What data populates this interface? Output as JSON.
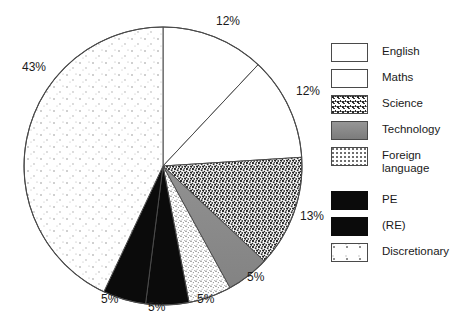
{
  "chart_data": {
    "type": "pie",
    "title": "",
    "subtitle": "",
    "xlabel": "",
    "ylabel": "",
    "units": "percent",
    "start_angle_deg": 0,
    "direction": "clockwise",
    "legend_position": "right",
    "grid": false,
    "categories": [
      "English",
      "Maths",
      "Science",
      "Technology",
      "Foreign language",
      "PE",
      "(RE)",
      "Discretionary"
    ],
    "values": [
      12,
      12,
      13,
      5,
      5,
      5,
      5,
      43
    ],
    "labels": [
      "12%",
      "12%",
      "13%",
      "5%",
      "5%",
      "5%",
      "5%",
      "43%"
    ],
    "slices": [
      {
        "name": "English",
        "value": 12,
        "label": "12%",
        "fill": "white",
        "color": "#ffffff",
        "start_deg": 0,
        "end_deg": 43.2
      },
      {
        "name": "Maths",
        "value": 12,
        "label": "12%",
        "fill": "white",
        "color": "#ffffff",
        "start_deg": 43.2,
        "end_deg": 86.4
      },
      {
        "name": "Science",
        "value": 13,
        "label": "13%",
        "fill": "speckle-coarse",
        "color": "#2a2a2a",
        "start_deg": 86.4,
        "end_deg": 133.2
      },
      {
        "name": "Technology",
        "value": 5,
        "label": "5%",
        "fill": "solid-gray",
        "color": "#8a8a8a",
        "start_deg": 133.2,
        "end_deg": 151.2
      },
      {
        "name": "Foreign language",
        "value": 5,
        "label": "5%",
        "fill": "speckle-light",
        "color": "#bdbdbd",
        "start_deg": 151.2,
        "end_deg": 169.2
      },
      {
        "name": "PE",
        "value": 5,
        "label": "5%",
        "fill": "black",
        "color": "#0b0b0b",
        "start_deg": 169.2,
        "end_deg": 187.2
      },
      {
        "name": "(RE)",
        "value": 5,
        "label": "5%",
        "fill": "black",
        "color": "#0b0b0b",
        "start_deg": 187.2,
        "end_deg": 205.2
      },
      {
        "name": "Discretionary",
        "value": 43,
        "label": "43%",
        "fill": "dots-sparse",
        "color": "#9a9a9a",
        "start_deg": 205.2,
        "end_deg": 360
      }
    ]
  },
  "pie": {
    "percent_labels": [
      {
        "text": "12%",
        "x": 216,
        "y": 14
      },
      {
        "text": "12%",
        "x": 296,
        "y": 84
      },
      {
        "text": "13%",
        "x": 300,
        "y": 209
      },
      {
        "text": "5%",
        "x": 247,
        "y": 270
      },
      {
        "text": "5%",
        "x": 197,
        "y": 292
      },
      {
        "text": "5%",
        "x": 148,
        "y": 300
      },
      {
        "text": "5%",
        "x": 101,
        "y": 292
      },
      {
        "text": "43%",
        "x": 22,
        "y": 60
      }
    ]
  },
  "legend": {
    "items": [
      {
        "label": "English",
        "swatch": "fill-white",
        "swatch_name": "legend-swatch-english"
      },
      {
        "label": "Maths",
        "swatch": "fill-white",
        "swatch_name": "legend-swatch-maths"
      },
      {
        "label": "Science",
        "swatch": "fill-science",
        "swatch_name": "legend-swatch-science"
      },
      {
        "label": "Technology",
        "swatch": "fill-solidgray",
        "swatch_name": "legend-swatch-technology"
      },
      {
        "label": "Foreign\nlanguage",
        "swatch": "fill-foreign",
        "swatch_name": "legend-swatch-foreign-language"
      },
      {
        "label": "PE",
        "swatch": "fill-black",
        "swatch_name": "legend-swatch-pe"
      },
      {
        "label": "(RE)",
        "swatch": "fill-black",
        "swatch_name": "legend-swatch-re"
      },
      {
        "label": "Discretionary",
        "swatch": "fill-disc",
        "swatch_name": "legend-swatch-discretionary"
      }
    ]
  }
}
